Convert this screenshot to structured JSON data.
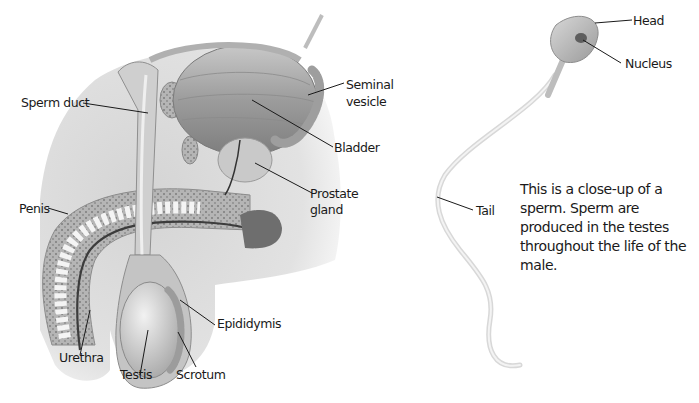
{
  "figure": {
    "left_diagram": {
      "name": "male reproductive system",
      "labels": {
        "sperm_duct": "Sperm duct",
        "seminal_vesicle_line1": "Seminal",
        "seminal_vesicle_line2": "vesicle",
        "bladder": "Bladder",
        "prostate_line1": "Prostate",
        "prostate_line2": "gland",
        "penis": "Penis",
        "epididymis": "Epididymis",
        "urethra": "Urethra",
        "testis": "Testis",
        "scrotum": "Scrotum"
      }
    },
    "right_diagram": {
      "name": "sperm cell",
      "labels": {
        "head": "Head",
        "nucleus": "Nucleus",
        "tail": "Tail"
      },
      "caption": "This is a close-up of a sperm. Sperm are produced in the testes throughout the life of the male."
    },
    "colors": {
      "body_bg": "#d9d9d9",
      "tissue": "#bdbdbd",
      "organ": "#a9a9a9",
      "leader_line": "#1a1a1a",
      "text": "#1a1a1a"
    }
  }
}
